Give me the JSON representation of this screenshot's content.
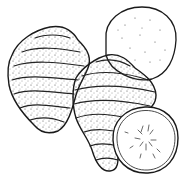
{
  "image": {
    "description": "Pen-and-ink illustration of two whole ridged tubers with two round cross-section slices",
    "style": "black and white stipple and line drawing",
    "objects": [
      {
        "name": "left-tuber",
        "kind": "whole tuber with horizontal ridges"
      },
      {
        "name": "middle-tuber",
        "kind": "whole tuber with horizontal ridges"
      },
      {
        "name": "upper-slice",
        "kind": "round cross-section slice, speckled flesh"
      },
      {
        "name": "lower-slice",
        "kind": "round cross-section slice with peel rim, radial speckles"
      }
    ],
    "colors": {
      "ink": "#1a1a1a",
      "paper": "#ffffff"
    }
  }
}
